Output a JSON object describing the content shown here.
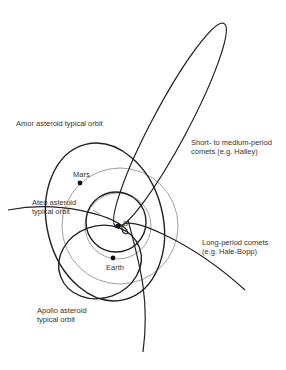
{
  "diagram": {
    "labels": {
      "amor": "Amor asteroid typical orbit",
      "mars": "Mars",
      "aten_line1": "Aten asteroid",
      "aten_line2": "typical orbit",
      "sun": "S",
      "earth": "Earth",
      "apollo_line1": "Apollo asteroid",
      "apollo_line2": "typical orbit",
      "short_comet_line1": "Short- to medium-period",
      "short_comet_line2": "comets (e.g. Halley)",
      "long_comet_line1": "Long-period comets",
      "long_comet_line2": "(e.g. Hale-Bopp)"
    },
    "colors": {
      "orbit_stroke": "#222222",
      "planet_orbit_stroke": "#777777",
      "text": "#333333",
      "background": "#ffffff"
    }
  }
}
